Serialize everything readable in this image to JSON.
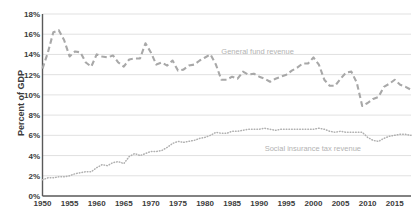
{
  "chart_data": {
    "type": "line",
    "title": "",
    "xlabel": "",
    "ylabel": "Percent of GDP",
    "grid": "horizontal",
    "legend_position": "inline-annotation",
    "xlim": [
      1950,
      2018
    ],
    "ylim": [
      0,
      18
    ],
    "ytick_labels": [
      "0%",
      "2%",
      "4%",
      "6%",
      "8%",
      "10%",
      "12%",
      "14%",
      "16%",
      "18%"
    ],
    "ytick_values": [
      0,
      2,
      4,
      6,
      8,
      10,
      12,
      14,
      16,
      18
    ],
    "xtick_labels": [
      "1950",
      "1955",
      "1960",
      "1965",
      "1970",
      "1975",
      "1980",
      "1985",
      "1990",
      "1995",
      "2000",
      "2005",
      "2010",
      "2015"
    ],
    "xtick_values": [
      1950,
      1955,
      1960,
      1965,
      1970,
      1975,
      1980,
      1985,
      1990,
      1995,
      2000,
      2005,
      2010,
      2015
    ],
    "x": [
      1950,
      1951,
      1952,
      1953,
      1954,
      1955,
      1956,
      1957,
      1958,
      1959,
      1960,
      1961,
      1962,
      1963,
      1964,
      1965,
      1966,
      1967,
      1968,
      1969,
      1970,
      1971,
      1972,
      1973,
      1974,
      1975,
      1976,
      1977,
      1978,
      1979,
      1980,
      1981,
      1982,
      1983,
      1984,
      1985,
      1986,
      1987,
      1988,
      1989,
      1990,
      1991,
      1992,
      1993,
      1994,
      1995,
      1996,
      1997,
      1998,
      1999,
      2000,
      2001,
      2002,
      2003,
      2004,
      2005,
      2006,
      2007,
      2008,
      2009,
      2010,
      2011,
      2012,
      2013,
      2014,
      2015,
      2016,
      2017,
      2018
    ],
    "series": [
      {
        "name": "General fund revenue",
        "color": "#a8a8a8",
        "dash": "long-dash",
        "values": [
          12.6,
          14.2,
          16.2,
          16.4,
          15.4,
          13.8,
          14.3,
          14.2,
          13.2,
          12.8,
          14.0,
          13.8,
          13.7,
          13.9,
          13.2,
          12.8,
          13.5,
          13.6,
          13.6,
          15.1,
          14.2,
          13.0,
          13.2,
          12.9,
          13.4,
          12.4,
          12.5,
          12.9,
          13.0,
          13.4,
          13.7,
          14.0,
          13.0,
          11.5,
          11.5,
          11.8,
          11.6,
          12.3,
          12.0,
          12.1,
          11.8,
          11.6,
          11.3,
          11.6,
          11.8,
          12.0,
          12.4,
          12.7,
          13.1,
          13.1,
          13.7,
          13.0,
          11.5,
          10.9,
          10.9,
          11.6,
          12.2,
          12.3,
          11.2,
          8.9,
          9.2,
          9.6,
          9.8,
          10.8,
          11.1,
          11.5,
          11.0,
          10.8,
          10.5
        ]
      },
      {
        "name": "Social insurance tax revenue",
        "color": "#b0b0b0",
        "dash": "dotted",
        "values": [
          1.6,
          1.8,
          1.8,
          1.9,
          1.9,
          2.0,
          2.2,
          2.3,
          2.4,
          2.4,
          2.8,
          3.1,
          3.0,
          3.3,
          3.4,
          3.2,
          3.9,
          4.2,
          4.0,
          4.2,
          4.4,
          4.4,
          4.5,
          4.8,
          5.2,
          5.4,
          5.3,
          5.4,
          5.5,
          5.7,
          5.8,
          6.0,
          6.3,
          6.2,
          6.2,
          6.4,
          6.4,
          6.5,
          6.6,
          6.6,
          6.6,
          6.7,
          6.6,
          6.5,
          6.6,
          6.6,
          6.6,
          6.6,
          6.6,
          6.6,
          6.6,
          6.7,
          6.6,
          6.4,
          6.3,
          6.4,
          6.3,
          6.3,
          6.3,
          6.3,
          5.8,
          5.5,
          5.4,
          5.7,
          5.9,
          6.0,
          6.1,
          6.1,
          6.0
        ]
      }
    ],
    "annotations": [
      {
        "text": "General fund revenue",
        "x": 1983,
        "y": 14.2
      },
      {
        "text": "Social insurance tax revenue",
        "x": 1991,
        "y": 4.6
      }
    ]
  },
  "axis": {
    "ylabel": "Percent of GDP"
  },
  "colors": {
    "gridline": "#d9d9d9",
    "axis": "#595959",
    "tick_text": "#3b3b3b",
    "series_general": "#a8a8a8",
    "series_social": "#b0b0b0",
    "annotation_text": "#b3b3b3",
    "background": "#ffffff"
  }
}
